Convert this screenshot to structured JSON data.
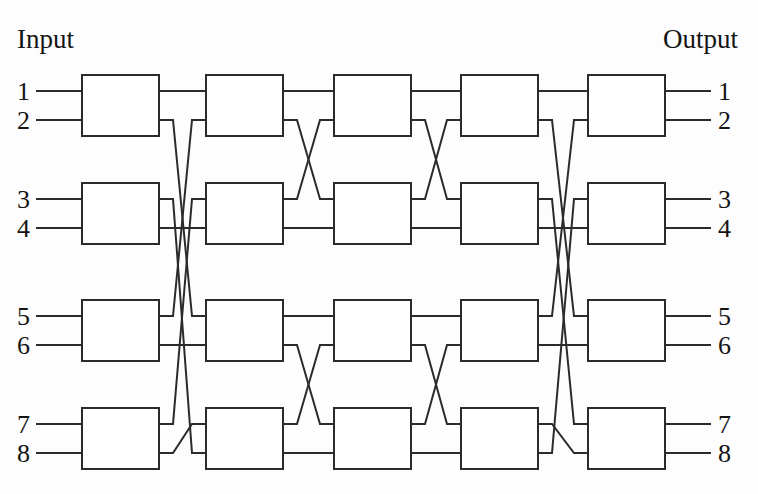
{
  "diagram": {
    "title_left": "Input",
    "title_right": "Output",
    "type": "benes-multistage-interconnection-network",
    "stage_count": 5,
    "switches_per_stage": 4,
    "port_count": 8,
    "line_color": "#2b2b2b",
    "box_fill": "#ffffff",
    "background": "#fdfdfd"
  },
  "input_labels": [
    "1",
    "2",
    "3",
    "4",
    "5",
    "6",
    "7",
    "8"
  ],
  "output_labels": [
    "1",
    "2",
    "3",
    "4",
    "5",
    "6",
    "7",
    "8"
  ],
  "switch_boxes": [
    {
      "stage": 1,
      "row": 1,
      "x": 82,
      "y": 75,
      "w": 77,
      "h": 61
    },
    {
      "stage": 1,
      "row": 2,
      "x": 82,
      "y": 183,
      "w": 77,
      "h": 61
    },
    {
      "stage": 1,
      "row": 3,
      "x": 82,
      "y": 300,
      "w": 77,
      "h": 61
    },
    {
      "stage": 1,
      "row": 4,
      "x": 82,
      "y": 408,
      "w": 77,
      "h": 61
    },
    {
      "stage": 2,
      "row": 1,
      "x": 206,
      "y": 75,
      "w": 77,
      "h": 61
    },
    {
      "stage": 2,
      "row": 2,
      "x": 206,
      "y": 183,
      "w": 77,
      "h": 61
    },
    {
      "stage": 2,
      "row": 3,
      "x": 206,
      "y": 300,
      "w": 77,
      "h": 61
    },
    {
      "stage": 2,
      "row": 4,
      "x": 206,
      "y": 408,
      "w": 77,
      "h": 61
    },
    {
      "stage": 3,
      "row": 1,
      "x": 334,
      "y": 75,
      "w": 77,
      "h": 61
    },
    {
      "stage": 3,
      "row": 2,
      "x": 334,
      "y": 183,
      "w": 77,
      "h": 61
    },
    {
      "stage": 3,
      "row": 3,
      "x": 334,
      "y": 300,
      "w": 77,
      "h": 61
    },
    {
      "stage": 3,
      "row": 4,
      "x": 334,
      "y": 408,
      "w": 77,
      "h": 61
    },
    {
      "stage": 4,
      "row": 1,
      "x": 461,
      "y": 75,
      "w": 77,
      "h": 61
    },
    {
      "stage": 4,
      "row": 2,
      "x": 461,
      "y": 183,
      "w": 77,
      "h": 61
    },
    {
      "stage": 4,
      "row": 3,
      "x": 461,
      "y": 300,
      "w": 77,
      "h": 61
    },
    {
      "stage": 4,
      "row": 4,
      "x": 461,
      "y": 408,
      "w": 77,
      "h": 61
    },
    {
      "stage": 5,
      "row": 1,
      "x": 588,
      "y": 75,
      "w": 77,
      "h": 61
    },
    {
      "stage": 5,
      "row": 2,
      "x": 588,
      "y": 183,
      "w": 77,
      "h": 61
    },
    {
      "stage": 5,
      "row": 3,
      "x": 588,
      "y": 300,
      "w": 77,
      "h": 61
    },
    {
      "stage": 5,
      "row": 4,
      "x": 588,
      "y": 408,
      "w": 77,
      "h": 61
    }
  ],
  "port_y": [
    91,
    120,
    199,
    228,
    316,
    345,
    424,
    453
  ],
  "stage_x": {
    "right_edges": [
      159,
      283,
      411,
      538,
      665
    ],
    "left_edges": [
      82,
      206,
      334,
      461,
      588
    ]
  },
  "permutations": {
    "stage_1_to_2": [
      1,
      5,
      8,
      4,
      2,
      6,
      3,
      7
    ],
    "stage_2_to_3": [
      1,
      3,
      2,
      4,
      5,
      7,
      6,
      8
    ],
    "stage_3_to_4": [
      1,
      3,
      2,
      4,
      5,
      7,
      6,
      8
    ],
    "stage_4_to_5": [
      1,
      5,
      7,
      4,
      2,
      6,
      8,
      3
    ]
  },
  "input_stub": {
    "x_start": 36,
    "x_end": 82
  },
  "output_stub": {
    "x_start": 665,
    "x_end": 711
  },
  "label_positions": {
    "input_title_x": 17,
    "input_title_y": 48,
    "output_title_x": 663,
    "output_title_y": 48,
    "left_numbers_x": 30,
    "right_numbers_x": 718
  }
}
